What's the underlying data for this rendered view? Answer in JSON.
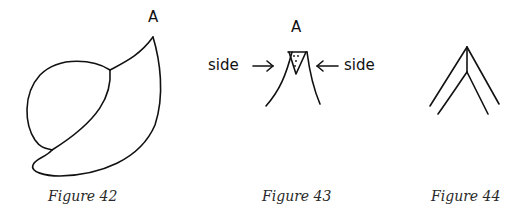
{
  "figures": [
    {
      "caption": "Figure 42",
      "label_a": "A"
    },
    {
      "caption": "Figure 43",
      "label_a": "A",
      "side_left": "side",
      "side_right": "side"
    },
    {
      "caption": "Figure 44"
    }
  ],
  "colors": {
    "ink": "#111111",
    "caption": "#2a2a2a",
    "background": "#ffffff"
  }
}
